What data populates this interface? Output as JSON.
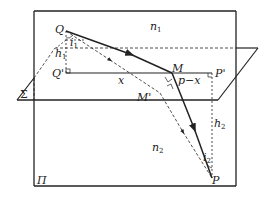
{
  "diagram": {
    "type": "geometry-optics",
    "colors": {
      "line": "#222222",
      "background": "#ffffff"
    },
    "planes": {
      "vertical_plane": {
        "label": "Π"
      },
      "horizontal_plane": {
        "label": "Σ"
      }
    },
    "points": {
      "Q": "Q",
      "Q_prime": "Q'",
      "M": "M",
      "M_prime": "M'",
      "P": "P",
      "P_prime": "P'"
    },
    "media": {
      "upper": {
        "base": "n",
        "sub": "1"
      },
      "lower": {
        "base": "n",
        "sub": "2"
      }
    },
    "heights": {
      "h1": {
        "base": "h",
        "sub": "1"
      },
      "h2": {
        "base": "h",
        "sub": "2"
      }
    },
    "angles": {
      "i1": {
        "base": "i",
        "sub": "1"
      },
      "i2": {
        "base": "i",
        "sub": "2"
      }
    },
    "segments": {
      "x": "x",
      "p_minus_x": "p−x"
    }
  }
}
